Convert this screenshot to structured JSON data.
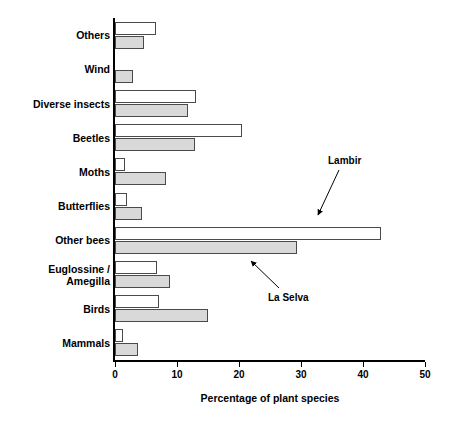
{
  "chart_data": {
    "type": "bar",
    "orientation": "horizontal",
    "title": "",
    "xlabel": "Percentage of plant  species",
    "ylabel": "",
    "xlim": [
      0,
      50
    ],
    "xticks": [
      0,
      10,
      20,
      30,
      40,
      50
    ],
    "xtick_labels": [
      "0",
      "10",
      "20",
      "30",
      "40",
      "50"
    ],
    "grid": false,
    "legend_position": "annotation-arrows",
    "categories": [
      "Others",
      "Wind",
      "Diverse insects",
      "Beetles",
      "Moths",
      "Butterflies",
      "Other bees",
      "Euglossine /\nAmegilla",
      "Birds",
      "Mammals"
    ],
    "series": [
      {
        "name": "Lambir",
        "color": "#ffffff",
        "values": [
          6.6,
          0,
          13.1,
          20.5,
          1.6,
          2.0,
          42.9,
          6.8,
          7.1,
          1.3
        ]
      },
      {
        "name": "La Selva",
        "color": "#d9d9d9",
        "values": [
          4.7,
          2.9,
          11.8,
          12.9,
          8.2,
          4.4,
          29.3,
          8.9,
          15.0,
          3.7
        ]
      }
    ],
    "annotations": [
      {
        "text": "Lambir",
        "points_to_series": "Lambir"
      },
      {
        "text": "La Selva",
        "points_to_series": "La Selva"
      }
    ]
  }
}
